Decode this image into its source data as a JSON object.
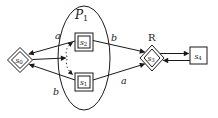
{
  "figure": {
    "background_color": "#ffffff",
    "ink_color": "#1a1a1a",
    "module": {
      "letter": "P",
      "sub": "1"
    },
    "annotation_r": "R",
    "nodes": {
      "s0": {
        "letter": "s",
        "sub": "0",
        "shape": "diamond",
        "border": "double"
      },
      "s1": {
        "letter": "s",
        "sub": "1",
        "shape": "square",
        "border": "double"
      },
      "s2": {
        "letter": "s",
        "sub": "2",
        "shape": "square",
        "border": "double"
      },
      "s3": {
        "letter": "s",
        "sub": "3",
        "shape": "diamond",
        "border": "double"
      },
      "s4": {
        "letter": "s",
        "sub": "4",
        "shape": "square",
        "border": "single"
      }
    },
    "edge_labels": {
      "s2_to_s0": "a",
      "s1_to_s0": "b",
      "s2_to_s3": "b",
      "s1_to_s3": "a"
    }
  }
}
